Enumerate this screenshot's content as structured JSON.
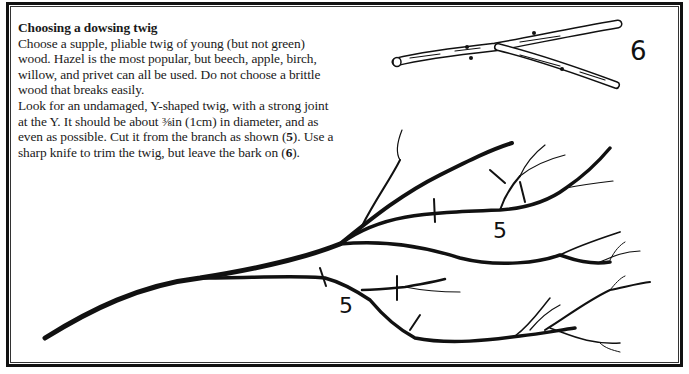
{
  "article": {
    "heading": "Choosing a dowsing twig",
    "paragraph1": "Choose a supple, pliable twig of young (but not green) wood. Hazel is the most popular, but beech, apple, birch, willow, and privet can all be used. Do not choose a brittle wood that breaks easily.",
    "paragraph2_parts": {
      "a": "Look for an undamaged, Y-shaped twig, with a strong joint at the Y. It should be about ",
      "fraction": "⅜in",
      "b": " (1cm) in diameter, and as even as possible. Cut it from the branch as shown (",
      "ref5": "5",
      "c": "). Use a sharp knife to trim the twig, but leave the bark on (",
      "ref6": "6",
      "d": ")."
    }
  },
  "illustration": {
    "twig_label": "6",
    "branch_labels": [
      "5",
      "5"
    ]
  },
  "colors": {
    "ink": "#111111",
    "paper": "#ffffff"
  }
}
